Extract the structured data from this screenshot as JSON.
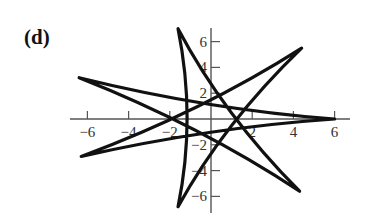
{
  "panel_label": "(d)",
  "chart_data": {
    "type": "line",
    "title": "",
    "panel": "(d)",
    "xlabel": "",
    "ylabel": "",
    "xlim": [
      -6.5,
      6.5
    ],
    "ylim": [
      -7.5,
      7.5
    ],
    "grid": false,
    "x_ticks": [
      -6,
      -4,
      -2,
      2,
      4,
      6
    ],
    "y_ticks": [
      6,
      4,
      2,
      -2,
      -4,
      -6
    ],
    "x_tick_labels": [
      "−6",
      "−4",
      "−2",
      "2",
      "4",
      "6"
    ],
    "y_tick_labels": [
      "6",
      "4",
      "2",
      "−2",
      "−4",
      "−6"
    ],
    "star_tips": [
      {
        "name": "right",
        "x": 6.0,
        "y": 0.0
      },
      {
        "name": "upper-right",
        "x": 4.4,
        "y": 5.5
      },
      {
        "name": "top",
        "x": -1.6,
        "y": 7.0
      },
      {
        "name": "upper-left",
        "x": -6.4,
        "y": 3.2
      },
      {
        "name": "lower-left",
        "x": -6.3,
        "y": -2.9
      },
      {
        "name": "bottom",
        "x": -1.6,
        "y": -6.8
      },
      {
        "name": "lower-right",
        "x": 4.3,
        "y": -5.6
      }
    ],
    "trace_order": [
      0,
      3,
      6,
      2,
      5,
      1,
      4,
      0
    ],
    "line_color": "#111111"
  }
}
